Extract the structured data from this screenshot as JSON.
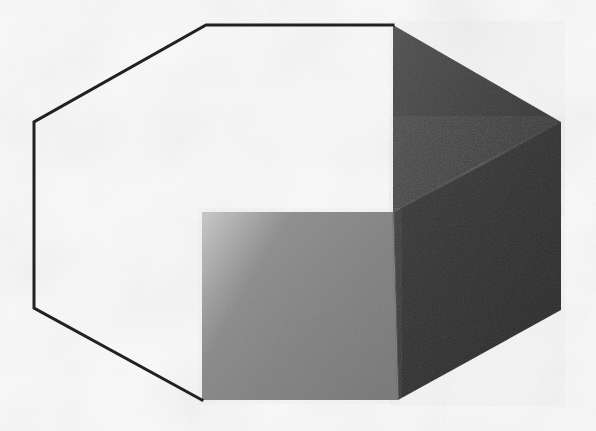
{
  "figure": {
    "kind": "geometric-optical-illusion",
    "canvas": {
      "width": 596,
      "height": 431
    },
    "background": {
      "color": "#fbfbfb",
      "texture": "paper-speckle",
      "description": "Off-white mottled paper background with faint gray flecks"
    },
    "outline": {
      "color": "#1a1a1a",
      "stroke_width": 3,
      "description": "Black hexagon outline drawn only along the unshaded upper-left border",
      "hexagon_points": "206,25 393,25 561,122 561,310 202,400 34,308 34,122"
    },
    "faces": [
      {
        "id": "face-top-dark",
        "label": "Upper dark rhombus face",
        "color": "#3a3a3a",
        "gradient_from": "#474747",
        "gradient_to": "#313131",
        "points": "393,25 561,122 561,125 393,212",
        "description": "Top-facing parallelogram of the cube, medium-dark"
      },
      {
        "id": "face-right-darkest",
        "label": "Right darkest face",
        "color": "#2a2a2a",
        "gradient_from": "#343434",
        "gradient_to": "#232323",
        "points": "561,122 561,310 398,400 393,212",
        "description": "Right-facing parallelogram of the cube, darkest value"
      },
      {
        "id": "face-front-gray",
        "label": "Front medium gray square face",
        "color": "#808080",
        "gradient_from": "#9a9a9a",
        "gradient_to": "#767676",
        "points": "202,212 393,212 398,400 202,400",
        "description": "Front-facing square of the inner cube, medium gray"
      }
    ],
    "creases": [
      {
        "id": "crease-top-right",
        "from": "393,212",
        "to": "561,122",
        "color": "#555555",
        "description": "Diagonal edge separating the two dark faces"
      },
      {
        "id": "crease-front-right",
        "from": "393,212",
        "to": "398,400",
        "color": "#6f6f6f",
        "description": "Vertical edge where the gray front face meets the dark right face"
      }
    ],
    "vertices": {
      "top_left": "206,25",
      "top_right": "393,25",
      "right_upper": "561,122",
      "right_lower": "561,310",
      "bottom": "202,400",
      "left_lower": "34,308",
      "left_upper": "34,122",
      "inner_corner": "393,212"
    },
    "readings": [
      "Large cube with a small cube removed from the near corner",
      "Small cube nested into the inside corner of a room"
    ]
  }
}
